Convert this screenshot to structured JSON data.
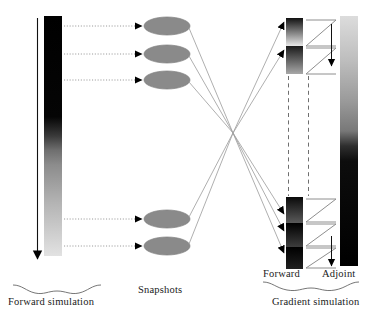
{
  "diagram": {
    "labels": {
      "snapshots": "Snapshots",
      "forward_simulation": "Forward simulation",
      "forward": "Forward",
      "adjoint": "Adjoint",
      "gradient_simulation": "Gradient simulation"
    },
    "colors": {
      "bar_dark": "#000000",
      "bar_light": "#d9d9d9",
      "snapshot_fill": "#8a8a8a",
      "snapshot_stroke": "#8a8a8a",
      "arrow_black": "#000000",
      "connector_gray": "#9a9a9a",
      "dotted_gray": "#8f8f8f",
      "dashed_gray": "#7a7a7a",
      "brace_gray": "#6f6f6f",
      "text": "#1a1a1a"
    },
    "forward_bar": {
      "name": "forward-simulation-bar",
      "x": 44,
      "y": 16,
      "width": 18,
      "height": 240,
      "gradient_top": "#000000",
      "gradient_bottom": "#dedede",
      "direction": "down",
      "arrow_x": 36
    },
    "snapshots": [
      {
        "id": 1,
        "cx": 167,
        "cy": 26,
        "rx": 23,
        "ry": 9
      },
      {
        "id": 2,
        "cx": 167,
        "cy": 54,
        "rx": 23,
        "ry": 9
      },
      {
        "id": 3,
        "cx": 167,
        "cy": 80,
        "rx": 23,
        "ry": 9
      },
      {
        "id": 4,
        "cx": 167,
        "cy": 219,
        "rx": 23,
        "ry": 9
      },
      {
        "id": 5,
        "cx": 167,
        "cy": 246,
        "rx": 23,
        "ry": 9
      }
    ],
    "snapshot_feed_arrows": [
      {
        "id": 1,
        "x1": 63,
        "x2": 143,
        "y": 26
      },
      {
        "id": 2,
        "x1": 63,
        "x2": 143,
        "y": 54
      },
      {
        "id": 3,
        "x1": 63,
        "x2": 143,
        "y": 80
      },
      {
        "id": 4,
        "x1": 63,
        "x2": 143,
        "y": 219
      },
      {
        "id": 5,
        "x1": 63,
        "x2": 143,
        "y": 246
      }
    ],
    "crossing_point": {
      "x": 233,
      "y": 133
    },
    "restore_connectors": [
      {
        "id": 1,
        "from_cx": 190,
        "from_cy": 26,
        "to_x": 286,
        "to_y": 230
      },
      {
        "id": 2,
        "from_cx": 190,
        "from_cy": 54,
        "to_x": 286,
        "to_y": 214
      },
      {
        "id": 3,
        "from_cx": 190,
        "from_cy": 80,
        "to_x": 286,
        "to_y": 252
      },
      {
        "id": 4,
        "from_cx": 190,
        "from_cy": 219,
        "to_x": 286,
        "to_y": 22
      },
      {
        "id": 5,
        "from_cx": 190,
        "from_cy": 246,
        "to_x": 286,
        "to_y": 49
      }
    ],
    "forward_segments": [
      {
        "id": 1,
        "x": 286,
        "y": 18,
        "width": 17,
        "height": 28,
        "top": "#111111",
        "bottom": "#e6e6e6"
      },
      {
        "id": 2,
        "x": 286,
        "y": 46,
        "width": 17,
        "height": 28,
        "top": "#1a1a1a",
        "bottom": "#a8a8a8"
      },
      {
        "id": 3,
        "x": 286,
        "y": 197,
        "width": 17,
        "height": 26,
        "top": "#0a0a0a",
        "bottom": "#5a5a5a"
      },
      {
        "id": 4,
        "x": 286,
        "y": 223,
        "width": 17,
        "height": 24,
        "top": "#000000",
        "bottom": "#3a3a3a"
      },
      {
        "id": 5,
        "x": 286,
        "y": 247,
        "width": 17,
        "height": 22,
        "top": "#000000",
        "bottom": "#242424"
      }
    ],
    "zigzag_paths": [
      {
        "id": 1,
        "x_left": 307,
        "x_right": 337,
        "y_top": 20,
        "y_bottom": 46
      },
      {
        "id": 2,
        "x_left": 307,
        "x_right": 337,
        "y_top": 48,
        "y_bottom": 74
      },
      {
        "id": 3,
        "x_left": 307,
        "x_right": 337,
        "y_top": 199,
        "y_bottom": 222
      },
      {
        "id": 4,
        "x_left": 307,
        "x_right": 337,
        "y_top": 224,
        "y_bottom": 246
      },
      {
        "id": 5,
        "x_left": 307,
        "x_right": 337,
        "y_top": 248,
        "y_bottom": 268
      }
    ],
    "adjoint_bar": {
      "name": "adjoint-simulation-bar",
      "x": 340,
      "y": 16,
      "width": 18,
      "height": 250,
      "gradient_top": "#d6d6d6",
      "gradient_bottom": "#000000",
      "direction": "up"
    },
    "adjoint_down_arrow": {
      "x": 331,
      "y_top": 22,
      "y_bottom": 72
    },
    "dashed_link": {
      "x": 288,
      "y_top": 76,
      "y_bottom": 196
    },
    "dashed_link_right": {
      "x": 308,
      "y_top": 76,
      "y_bottom": 196
    },
    "braces": {
      "forward_simulation": {
        "x1": 12,
        "x2": 108,
        "y": 288,
        "tip_down": false
      },
      "gradient_simulation": {
        "x1": 262,
        "x2": 360,
        "y": 288,
        "tip_down": false
      }
    }
  }
}
